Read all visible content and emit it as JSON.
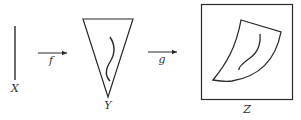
{
  "diagram": {
    "colors": {
      "stroke": "#2a2a2a",
      "label": "#333333",
      "background": "#ffffff"
    },
    "spaces": [
      {
        "id": "X",
        "label": "X",
        "shape": "vertical-segment"
      },
      {
        "id": "Y",
        "label": "Y",
        "shape": "inverted-triangle-with-curve"
      },
      {
        "id": "Z",
        "label": "Z",
        "shape": "curved-quadrilateral-with-curve-in-box"
      }
    ],
    "maps": [
      {
        "label": "f",
        "from": "X",
        "to": "Y"
      },
      {
        "label": "g",
        "from": "Y",
        "to": "Z"
      }
    ]
  }
}
